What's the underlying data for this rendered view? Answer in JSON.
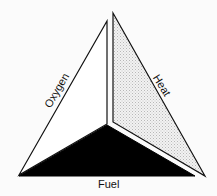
{
  "diagram": {
    "faces": [
      {
        "name": "Oxygen",
        "label": "Oxygen",
        "fill": "#ffffff",
        "pattern": "none"
      },
      {
        "name": "Heat",
        "label": "Heat",
        "fill": "#e6e6e6",
        "pattern": "stipple"
      },
      {
        "name": "Fuel",
        "label": "Fuel",
        "fill": "#000000",
        "pattern": "solid"
      }
    ],
    "colors": {
      "background": "#fbfbfb",
      "stroke": "#111111",
      "stipple": "#bdbdbd"
    }
  }
}
